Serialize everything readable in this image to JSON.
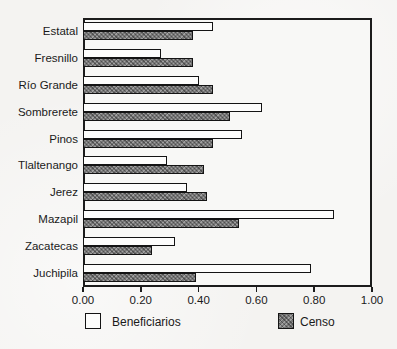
{
  "chart_data": {
    "type": "bar",
    "orientation": "horizontal",
    "title": "",
    "xlabel": "",
    "ylabel": "",
    "categories": [
      "Estatal",
      "Fresnillo",
      "Río Grande",
      "Sombrerete",
      "Pinos",
      "Tlaltenango",
      "Jerez",
      "Mazapil",
      "Zacatecas",
      "Juchipila"
    ],
    "series": [
      {
        "name": "Beneficiarios",
        "style": "light",
        "values": [
          0.45,
          0.27,
          0.4,
          0.62,
          0.55,
          0.29,
          0.36,
          0.87,
          0.32,
          0.79
        ]
      },
      {
        "name": "Censo",
        "style": "dark",
        "values": [
          0.38,
          0.38,
          0.45,
          0.51,
          0.45,
          0.42,
          0.43,
          0.54,
          0.24,
          0.39
        ]
      }
    ],
    "xlim": [
      0,
      1
    ],
    "xticks": [
      "0.00",
      "0.20",
      "0.40",
      "0.60",
      "0.80",
      "1.00"
    ],
    "xtick_values": [
      0,
      0.2,
      0.4,
      0.6,
      0.8,
      1.0
    ],
    "grid": false,
    "legend_position": "bottom"
  },
  "colors": {
    "frame": "#1c1c1c",
    "background": "#f4f3f1",
    "bar_light_fill": "#fdfdfc",
    "bar_dark_fill": "#787878",
    "bar_border": "#141414",
    "text": "#1a1a1a"
  }
}
